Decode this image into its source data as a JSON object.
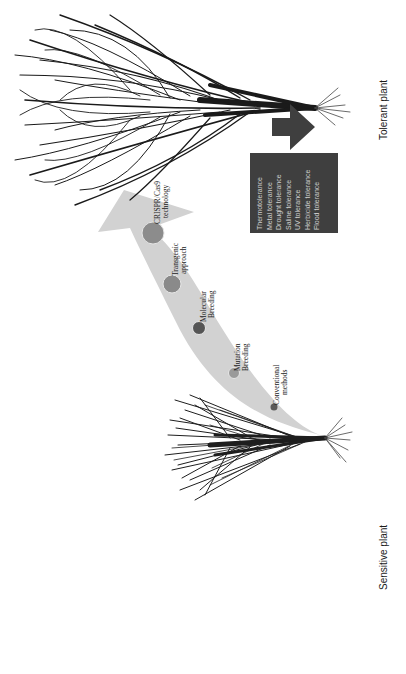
{
  "diagram": {
    "orientation": "rotated-90-ccw",
    "start_label": "Sensitive plant",
    "end_label": "Tolerant plant",
    "arrow_color": "#cfcfcf",
    "steps": [
      {
        "label_line1": "Conventional",
        "label_line2": "methods",
        "color": "#5a5a5a",
        "size": "small"
      },
      {
        "label_line1": "Mutation",
        "label_line2": "Breeding",
        "color": "#9a9a9a",
        "size": "medium"
      },
      {
        "label_line1": "Molecular",
        "label_line2": "Breeding",
        "color": "#555555",
        "size": "medium"
      },
      {
        "label_line1": "Transgenic",
        "label_line2": "approach",
        "color": "#8a8a8a",
        "size": "large"
      },
      {
        "label_line1": "CRISPR/Cas9",
        "label_line2": "technology",
        "color": "#8c8c8c",
        "size": "large"
      }
    ],
    "tolerance_box": {
      "color": "#3f3f3f",
      "text_color": "#d0d0d0",
      "items": [
        "Thermotolerance",
        "Metal  tolerance",
        "Drought  tolerance",
        "Saline  tolerance",
        "UV  tolerance",
        "Herbicide  tolerance",
        "Flood  tolerance"
      ]
    }
  }
}
